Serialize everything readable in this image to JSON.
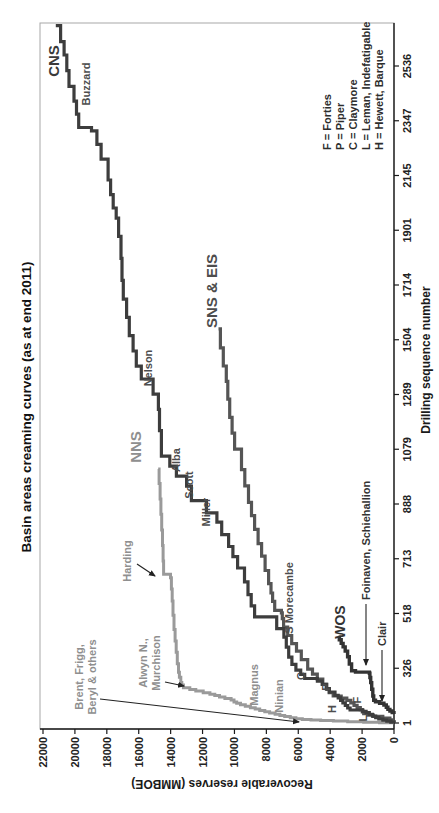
{
  "chart_data": {
    "type": "line",
    "subtype": "step-creaming-curves",
    "title": "Basin areas creaming curves (as at end 2011)",
    "xlabel": "Drilling sequence number",
    "ylabel": "Recoverable reserves (MMBOE)",
    "x_ticks": [
      1,
      326,
      518,
      713,
      888,
      1079,
      1289,
      1504,
      1714,
      1901,
      2145,
      2347,
      2536
    ],
    "y_ticks": [
      0,
      2000,
      4000,
      6000,
      8000,
      10000,
      12000,
      14000,
      16000,
      18000,
      20000,
      22000
    ],
    "ylim": [
      0,
      22000
    ],
    "grid": false,
    "legend_position": "inside-lower-right",
    "orientation": "chart rotated 90 degrees counter-clockwise within portrait image",
    "series": [
      {
        "name": "CNS",
        "color": "#3d3d3d",
        "width": 3.2,
        "points": [
          [
            1,
            0
          ],
          [
            6,
            200
          ],
          [
            12,
            450
          ],
          [
            18,
            700
          ],
          [
            25,
            950
          ],
          [
            33,
            1150
          ],
          [
            42,
            1350
          ],
          [
            52,
            1550
          ],
          [
            62,
            1750
          ],
          [
            70,
            1950
          ],
          [
            78,
            2750
          ],
          [
            90,
            2900
          ],
          [
            105,
            3050
          ],
          [
            120,
            3200
          ],
          [
            135,
            3350
          ],
          [
            150,
            3500
          ],
          [
            165,
            3700
          ],
          [
            185,
            4050
          ],
          [
            205,
            4250
          ],
          [
            230,
            4500
          ],
          [
            250,
            4800
          ],
          [
            265,
            5600
          ],
          [
            290,
            5850
          ],
          [
            315,
            6150
          ],
          [
            340,
            6400
          ],
          [
            365,
            6600
          ],
          [
            400,
            6750
          ],
          [
            435,
            6900
          ],
          [
            465,
            7350
          ],
          [
            506,
            8740
          ],
          [
            545,
            8950
          ],
          [
            585,
            9150
          ],
          [
            631,
            9370
          ],
          [
            680,
            9800
          ],
          [
            720,
            10100
          ],
          [
            752,
            10370
          ],
          [
            790,
            10800
          ],
          [
            830,
            11100
          ],
          [
            860,
            11760
          ],
          [
            900,
            12700
          ],
          [
            950,
            13000
          ],
          [
            985,
            13640
          ],
          [
            1020,
            14050
          ],
          [
            1055,
            14580
          ],
          [
            1150,
            14700
          ],
          [
            1232,
            14770
          ],
          [
            1290,
            15100
          ],
          [
            1350,
            15840
          ],
          [
            1400,
            16150
          ],
          [
            1460,
            16350
          ],
          [
            1520,
            16590
          ],
          [
            1590,
            16760
          ],
          [
            1660,
            16970
          ],
          [
            1730,
            17050
          ],
          [
            1805,
            17110
          ],
          [
            1880,
            17260
          ],
          [
            1955,
            17410
          ],
          [
            2000,
            17600
          ],
          [
            2060,
            17760
          ],
          [
            2125,
            17920
          ],
          [
            2205,
            18360
          ],
          [
            2260,
            18620
          ],
          [
            2310,
            18960
          ],
          [
            2322,
            19760
          ],
          [
            2370,
            19900
          ],
          [
            2415,
            20060
          ],
          [
            2466,
            20370
          ],
          [
            2520,
            20510
          ],
          [
            2574,
            20680
          ],
          [
            2620,
            20900
          ],
          [
            2675,
            21200
          ]
        ]
      },
      {
        "name": "NNS",
        "color": "#9a9a9a",
        "width": 3,
        "points": [
          [
            1,
            0
          ],
          [
            3,
            900
          ],
          [
            6,
            1900
          ],
          [
            9,
            2900
          ],
          [
            12,
            3800
          ],
          [
            15,
            4600
          ],
          [
            18,
            5200
          ],
          [
            21,
            5750
          ],
          [
            26,
            6150
          ],
          [
            32,
            6500
          ],
          [
            39,
            6850
          ],
          [
            46,
            7150
          ],
          [
            53,
            7450
          ],
          [
            60,
            7800
          ],
          [
            68,
            8100
          ],
          [
            76,
            8420
          ],
          [
            84,
            8700
          ],
          [
            92,
            9000
          ],
          [
            101,
            9320
          ],
          [
            109,
            9620
          ],
          [
            118,
            9860
          ],
          [
            126,
            10030
          ],
          [
            138,
            10210
          ],
          [
            147,
            10600
          ],
          [
            156,
            10940
          ],
          [
            164,
            11230
          ],
          [
            172,
            11540
          ],
          [
            181,
            11960
          ],
          [
            191,
            12420
          ],
          [
            200,
            12800
          ],
          [
            210,
            13200
          ],
          [
            226,
            13300
          ],
          [
            242,
            13360
          ],
          [
            272,
            13450
          ],
          [
            302,
            13510
          ],
          [
            342,
            13580
          ],
          [
            382,
            13650
          ],
          [
            422,
            13720
          ],
          [
            462,
            13790
          ],
          [
            512,
            13850
          ],
          [
            562,
            13900
          ],
          [
            605,
            13950
          ],
          [
            645,
            14010
          ],
          [
            658,
            14440
          ],
          [
            705,
            14470
          ],
          [
            755,
            14510
          ],
          [
            805,
            14560
          ],
          [
            855,
            14610
          ],
          [
            905,
            14660
          ],
          [
            960,
            14720
          ],
          [
            1010,
            14780
          ]
        ]
      },
      {
        "name": "SNS & EIS",
        "color": "#555555",
        "width": 3.2,
        "points": [
          [
            1,
            0
          ],
          [
            10,
            130
          ],
          [
            20,
            260
          ],
          [
            30,
            700
          ],
          [
            40,
            1300
          ],
          [
            48,
            1650
          ],
          [
            56,
            1900
          ],
          [
            66,
            1990
          ],
          [
            80,
            2110
          ],
          [
            93,
            2310
          ],
          [
            106,
            2510
          ],
          [
            121,
            2710
          ],
          [
            136,
            2960
          ],
          [
            149,
            3310
          ],
          [
            161,
            3810
          ],
          [
            181,
            4060
          ],
          [
            201,
            4210
          ],
          [
            231,
            4460
          ],
          [
            261,
            4810
          ],
          [
            291,
            5110
          ],
          [
            321,
            5410
          ],
          [
            356,
            5810
          ],
          [
            386,
            6110
          ],
          [
            412,
            6410
          ],
          [
            441,
            6660
          ],
          [
            470,
            6920
          ],
          [
            500,
            7000
          ],
          [
            520,
            7060
          ],
          [
            529,
            7480
          ],
          [
            561,
            7610
          ],
          [
            591,
            7710
          ],
          [
            624,
            7860
          ],
          [
            671,
            8080
          ],
          [
            721,
            8300
          ],
          [
            761,
            8520
          ],
          [
            807,
            8740
          ],
          [
            851,
            8930
          ],
          [
            894,
            9120
          ],
          [
            951,
            9350
          ],
          [
            1008,
            9560
          ],
          [
            1079,
            9990
          ],
          [
            1141,
            10150
          ],
          [
            1201,
            10300
          ],
          [
            1271,
            10420
          ],
          [
            1341,
            10510
          ],
          [
            1401,
            10700
          ],
          [
            1472,
            10880
          ],
          [
            1546,
            11000
          ]
        ]
      },
      {
        "name": "WOS",
        "color": "#333333",
        "width": 3.4,
        "points": [
          [
            55,
            0
          ],
          [
            63,
            110
          ],
          [
            72,
            260
          ],
          [
            82,
            380
          ],
          [
            95,
            480
          ],
          [
            108,
            630
          ],
          [
            118,
            900
          ],
          [
            127,
            1160
          ],
          [
            136,
            1270
          ],
          [
            161,
            1330
          ],
          [
            201,
            1400
          ],
          [
            241,
            1460
          ],
          [
            271,
            1510
          ],
          [
            296,
            1540
          ],
          [
            303,
            2410
          ],
          [
            311,
            2660
          ],
          [
            341,
            2800
          ],
          [
            366,
            2910
          ],
          [
            386,
            3060
          ],
          [
            401,
            3190
          ],
          [
            413,
            3310
          ],
          [
            426,
            3430
          ],
          [
            435,
            3470
          ]
        ]
      }
    ],
    "annotations": [
      {
        "text": "CNS",
        "x": 752,
        "y": 59,
        "size": 15,
        "color": "#3a3a3a",
        "anchor": "middle",
        "name": "label-cns"
      },
      {
        "text": "NNS",
        "x": 366,
        "y": 141,
        "size": 15,
        "color": "#8f8f8f",
        "anchor": "middle",
        "name": "label-nns"
      },
      {
        "text": "SNS & EIS",
        "x": 522,
        "y": 217,
        "size": 15,
        "color": "#4d4d4d",
        "anchor": "middle",
        "name": "label-sns-eis"
      },
      {
        "text": "WOS",
        "x": 191,
        "y": 345,
        "size": 14,
        "color": "#333333",
        "anchor": "middle",
        "name": "label-wos"
      },
      {
        "text": "Buzzard",
        "x": 729,
        "y": 90,
        "size": 11,
        "color": "#4d4d4d",
        "anchor": "middle",
        "name": "label-buzzard"
      },
      {
        "text": "Nelson",
        "x": 445,
        "y": 152,
        "size": 11,
        "color": "#4d4d4d",
        "anchor": "middle",
        "name": "label-nelson"
      },
      {
        "text": "Alba",
        "x": 353,
        "y": 180,
        "size": 11,
        "color": "#4d4d4d",
        "anchor": "middle",
        "name": "label-alba"
      },
      {
        "text": "Scott",
        "x": 328,
        "y": 193,
        "size": 11,
        "color": "#4d4d4d",
        "anchor": "middle",
        "name": "label-scott"
      },
      {
        "text": "Miller",
        "x": 301,
        "y": 210,
        "size": 11,
        "color": "#4d4d4d",
        "anchor": "middle",
        "name": "label-miller"
      },
      {
        "text": "Harding",
        "x": 252,
        "y": 131,
        "size": 11,
        "color": "#8f8f8f",
        "anchor": "middle",
        "name": "label-harding"
      },
      {
        "text": "Alwyn N.,",
        "x": 150,
        "y": 147,
        "size": 11,
        "color": "#8f8f8f",
        "anchor": "middle",
        "name": "label-alwyn-n"
      },
      {
        "text": "Murchison",
        "x": 150,
        "y": 160,
        "size": 11,
        "color": "#8f8f8f",
        "anchor": "middle",
        "name": "label-murchison"
      },
      {
        "text": "Brent, Frigg,",
        "x": 136,
        "y": 83,
        "size": 11,
        "color": "#8f8f8f",
        "anchor": "middle",
        "name": "label-brent-frigg"
      },
      {
        "text": "Beryl & others",
        "x": 136,
        "y": 96,
        "size": 11,
        "color": "#8f8f8f",
        "anchor": "middle",
        "name": "label-beryl-others"
      },
      {
        "text": "Magnus",
        "x": 128,
        "y": 258,
        "size": 11,
        "color": "#8f8f8f",
        "anchor": "middle",
        "name": "label-magnus"
      },
      {
        "text": "Ninian",
        "x": 117,
        "y": 283,
        "size": 11,
        "color": "#8f8f8f",
        "anchor": "middle",
        "name": "label-ninian"
      },
      {
        "text": "C",
        "x": 137,
        "y": 305,
        "size": 11,
        "color": "#4d4d4d",
        "anchor": "middle",
        "name": "label-c"
      },
      {
        "text": "P",
        "x": 126,
        "y": 330,
        "size": 11,
        "color": "#4d4d4d",
        "anchor": "middle",
        "name": "label-p"
      },
      {
        "text": "H",
        "x": 104,
        "y": 336,
        "size": 11,
        "color": "#4d4d4d",
        "anchor": "middle",
        "name": "label-h"
      },
      {
        "text": "F",
        "x": 113,
        "y": 361,
        "size": 11,
        "color": "#4d4d4d",
        "anchor": "middle",
        "name": "label-f"
      },
      {
        "text": "L",
        "x": 95,
        "y": 367,
        "size": 11,
        "color": "#4d4d4d",
        "anchor": "middle",
        "name": "label-l"
      },
      {
        "text": "S Morecambe",
        "x": 215,
        "y": 293,
        "size": 11,
        "color": "#4d4d4d",
        "anchor": "middle",
        "name": "label-s-morecambe"
      },
      {
        "text": "Foinaven, Schiehallion",
        "x": 213,
        "y": 370,
        "size": 11,
        "color": "#333333",
        "anchor": "start",
        "name": "label-foinaven-schiehallion"
      },
      {
        "text": "Clair",
        "x": 167,
        "y": 386,
        "size": 11,
        "color": "#333333",
        "anchor": "start",
        "name": "label-clair"
      }
    ],
    "arrows": [
      {
        "x1": 249,
        "y1": 137,
        "x2": 237,
        "y2": 155,
        "name": "harding-arrow"
      },
      {
        "x1": 131,
        "y1": 165,
        "x2": 127,
        "y2": 184,
        "name": "alwyn-murchison-arrow"
      },
      {
        "x1": 114,
        "y1": 100,
        "x2": 91,
        "y2": 299,
        "name": "brent-frigg-beryl-arrow"
      },
      {
        "x1": 209,
        "y1": 366,
        "x2": 148,
        "y2": 366,
        "name": "foinaven-schiehallion-arrow"
      },
      {
        "x1": 163,
        "y1": 382,
        "x2": 112,
        "y2": 382,
        "name": "clair-arrow"
      }
    ]
  },
  "legend": {
    "items": [
      "F = Forties",
      "P = Piper",
      "C = Claymore",
      "L = Leman, Indefatigable",
      "H = Hewett, Barque"
    ]
  },
  "colors": {
    "axis": "#1a1a1a",
    "plot_border": "#a8a8a8",
    "tick_label": "#222222",
    "background": "#ffffff"
  }
}
